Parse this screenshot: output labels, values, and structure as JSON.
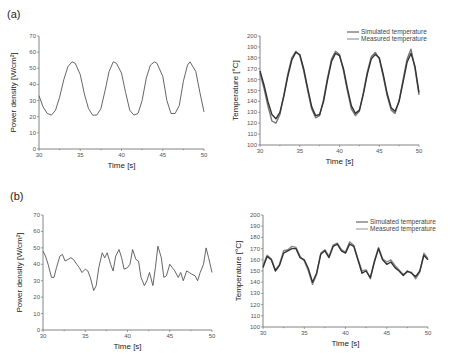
{
  "panels": {
    "a": {
      "label": "(a)"
    },
    "b": {
      "label": "(b)"
    }
  },
  "chart_data": [
    {
      "id": "a-power",
      "panel": "(a)",
      "type": "line",
      "title": "",
      "xlabel": "Time [s]",
      "ylabel": "Power density [W/cm²]",
      "xlim": [
        30,
        50
      ],
      "ylim": [
        0,
        70
      ],
      "xticks": [
        30,
        35,
        40,
        45,
        50
      ],
      "yticks": [
        0,
        10,
        20,
        30,
        40,
        50,
        60,
        70
      ],
      "grid": false,
      "series": [
        {
          "name": "Power density",
          "color": "#555555",
          "x": [
            30,
            30.5,
            31,
            31.5,
            32,
            32.5,
            33,
            33.5,
            34,
            34.4,
            35,
            35.5,
            36,
            36.5,
            37,
            37.5,
            38,
            38.5,
            39,
            39.4,
            40,
            40.5,
            41,
            41.5,
            42,
            42.5,
            43,
            43.5,
            44,
            44.3,
            45,
            45.5,
            46,
            46.5,
            47,
            47.5,
            48,
            48.3,
            49,
            49.5,
            50
          ],
          "y": [
            33,
            26,
            22,
            21,
            24,
            32,
            43,
            51,
            54,
            53,
            46,
            34,
            25,
            21,
            21,
            25,
            36,
            48,
            54,
            53,
            47,
            35,
            24,
            21,
            22,
            30,
            44,
            52,
            54,
            53,
            45,
            30,
            22,
            22,
            27,
            42,
            52,
            54,
            48,
            35,
            23
          ]
        }
      ]
    },
    {
      "id": "a-temperature",
      "panel": "(a)",
      "type": "line",
      "title": "",
      "xlabel": "Time [s]",
      "ylabel": "Temperature [°C]",
      "xlim": [
        30,
        50
      ],
      "ylim": [
        100,
        200
      ],
      "xticks": [
        30,
        35,
        40,
        45,
        50
      ],
      "yticks": [
        100,
        110,
        120,
        130,
        140,
        150,
        160,
        170,
        180,
        190,
        200
      ],
      "grid": false,
      "legend": {
        "position": "upper right",
        "entries": [
          "Simulated temperature",
          "Measured temperature"
        ]
      },
      "series": [
        {
          "name": "Simulated temperature",
          "color": "#333333",
          "x": [
            30,
            30.5,
            31,
            31.5,
            32,
            32.5,
            33,
            33.5,
            34,
            34.5,
            35,
            35.5,
            36,
            36.5,
            37,
            37.5,
            38,
            38.5,
            39,
            39.5,
            40,
            40.5,
            41,
            41.5,
            42,
            42.5,
            43,
            43.5,
            44,
            44.5,
            45,
            45.5,
            46,
            46.5,
            47,
            47.5,
            48,
            48.5,
            49,
            49.5,
            50
          ],
          "y": [
            168,
            155,
            140,
            128,
            124,
            130,
            145,
            163,
            178,
            185,
            183,
            170,
            152,
            135,
            127,
            128,
            140,
            160,
            177,
            184,
            182,
            170,
            152,
            136,
            129,
            132,
            147,
            165,
            179,
            183,
            180,
            165,
            147,
            134,
            131,
            140,
            158,
            176,
            184,
            172,
            148
          ]
        },
        {
          "name": "Measured temperature",
          "color": "#777777",
          "x": [
            30,
            30.5,
            31,
            31.5,
            32,
            32.5,
            33,
            33.5,
            34,
            34.5,
            35,
            35.5,
            36,
            36.5,
            37,
            37.5,
            38,
            38.5,
            39,
            39.5,
            40,
            40.5,
            41,
            41.5,
            42,
            42.5,
            43,
            43.5,
            44,
            44.5,
            45,
            45.5,
            46,
            46.5,
            47,
            47.5,
            48,
            48.5,
            49,
            49.5,
            50
          ],
          "y": [
            166,
            152,
            136,
            122,
            120,
            128,
            146,
            165,
            180,
            186,
            182,
            168,
            150,
            133,
            125,
            127,
            142,
            162,
            179,
            186,
            183,
            168,
            150,
            133,
            127,
            131,
            148,
            167,
            181,
            185,
            179,
            163,
            145,
            132,
            129,
            141,
            160,
            179,
            188,
            170,
            146
          ]
        }
      ]
    },
    {
      "id": "b-power",
      "panel": "(b)",
      "type": "line",
      "title": "",
      "xlabel": "Time [s]",
      "ylabel": "Power density [W/cm²]",
      "xlim": [
        30,
        50
      ],
      "ylim": [
        0,
        70
      ],
      "xticks": [
        30,
        35,
        40,
        45,
        50
      ],
      "yticks": [
        0,
        10,
        20,
        30,
        40,
        50,
        60,
        70
      ],
      "grid": false,
      "series": [
        {
          "name": "Power density",
          "color": "#555555",
          "x": [
            30,
            30.3,
            30.6,
            31,
            31.3,
            31.6,
            32,
            32.3,
            32.6,
            33,
            33.3,
            33.6,
            34,
            34.3,
            34.6,
            35,
            35.3,
            35.6,
            36,
            36.3,
            36.6,
            37,
            37.3,
            37.6,
            38,
            38.3,
            38.6,
            39,
            39.3,
            39.6,
            40,
            40.3,
            40.6,
            41,
            41.3,
            41.6,
            42,
            42.3,
            42.6,
            43,
            43.3,
            43.6,
            44,
            44.3,
            44.6,
            45,
            45.3,
            45.6,
            46,
            46.3,
            46.6,
            47,
            47.3,
            47.6,
            48,
            48.3,
            48.6,
            49,
            49.3,
            49.6,
            50
          ],
          "y": [
            48,
            45,
            40,
            32,
            32,
            38,
            45,
            46,
            42,
            43,
            44,
            43,
            40,
            38,
            35,
            37,
            36,
            32,
            24,
            27,
            38,
            47,
            44,
            47,
            40,
            36,
            45,
            49,
            44,
            37,
            38,
            40,
            49,
            43,
            42,
            32,
            27,
            30,
            35,
            27,
            38,
            51,
            44,
            32,
            33,
            40,
            38,
            36,
            32,
            35,
            30,
            36,
            35,
            34,
            33,
            30,
            35,
            40,
            50,
            44,
            35
          ]
        }
      ]
    },
    {
      "id": "b-temperature",
      "panel": "(b)",
      "type": "line",
      "title": "",
      "xlabel": "Time [s]",
      "ylabel": "Temperature [°C]",
      "xlim": [
        30,
        50
      ],
      "ylim": [
        100,
        200
      ],
      "xticks": [
        30,
        35,
        40,
        45,
        50
      ],
      "yticks": [
        100,
        110,
        120,
        130,
        140,
        150,
        160,
        170,
        180,
        190,
        200
      ],
      "grid": false,
      "legend": {
        "position": "upper right",
        "entries": [
          "Simulated temperature",
          "Measured temperature"
        ]
      },
      "series": [
        {
          "name": "Simulated temperature",
          "color": "#333333",
          "x": [
            30,
            30.5,
            31,
            31.5,
            32,
            32.5,
            33,
            33.5,
            34,
            34.5,
            35,
            35.5,
            36,
            36.5,
            37,
            37.5,
            38,
            38.5,
            39,
            39.5,
            40,
            40.5,
            41,
            41.5,
            42,
            42.5,
            43,
            43.5,
            44,
            44.5,
            45,
            45.5,
            46,
            46.5,
            47,
            47.5,
            48,
            48.5,
            49,
            49.5,
            50
          ],
          "y": [
            153,
            163,
            160,
            150,
            155,
            166,
            168,
            170,
            170,
            162,
            160,
            152,
            140,
            148,
            165,
            168,
            162,
            172,
            174,
            168,
            166,
            174,
            172,
            160,
            148,
            150,
            144,
            158,
            170,
            160,
            156,
            158,
            153,
            150,
            146,
            150,
            148,
            145,
            150,
            164,
            160
          ]
        },
        {
          "name": "Measured temperature",
          "color": "#888888",
          "x": [
            30,
            30.5,
            31,
            31.5,
            32,
            32.5,
            33,
            33.5,
            34,
            34.5,
            35,
            35.5,
            36,
            36.5,
            37,
            37.5,
            38,
            38.5,
            39,
            39.5,
            40,
            40.5,
            41,
            41.5,
            42,
            42.5,
            43,
            43.5,
            44,
            44.5,
            45,
            45.5,
            46,
            46.5,
            47,
            47.5,
            48,
            48.5,
            49,
            49.5,
            50
          ],
          "y": [
            155,
            164,
            161,
            151,
            156,
            168,
            169,
            172,
            171,
            163,
            159,
            150,
            138,
            147,
            166,
            169,
            163,
            173,
            175,
            169,
            167,
            176,
            173,
            161,
            150,
            151,
            143,
            159,
            171,
            161,
            158,
            160,
            155,
            151,
            147,
            149,
            149,
            143,
            149,
            166,
            161
          ]
        }
      ]
    }
  ],
  "caption_fragment": "ers distribution. (b) simulated temperature for the fractions... (b) a  ..."
}
